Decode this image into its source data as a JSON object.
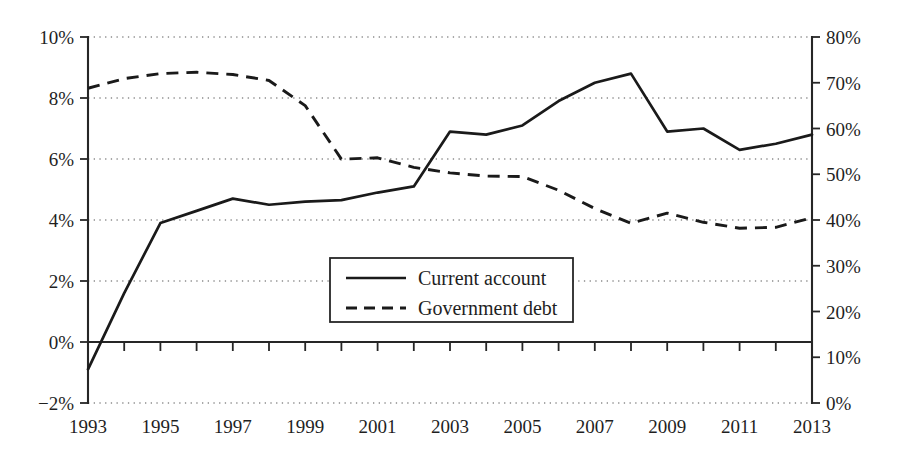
{
  "chart_data": {
    "type": "line",
    "title": "",
    "subtitle": "",
    "xlabel": "",
    "grid": "dotted-horizontal",
    "legend_position": "inside-bottom-center",
    "x": [
      1993,
      1994,
      1995,
      1996,
      1997,
      1998,
      1999,
      2000,
      2001,
      2002,
      2003,
      2004,
      2005,
      2006,
      2007,
      2008,
      2009,
      2010,
      2011,
      2012,
      2013
    ],
    "x_tick_labels": [
      "1993",
      "1995",
      "1997",
      "1999",
      "2001",
      "2003",
      "2005",
      "2007",
      "2009",
      "2011",
      "2013"
    ],
    "x_tick_values": [
      1993,
      1995,
      1997,
      1999,
      2001,
      2003,
      2005,
      2007,
      2009,
      2011,
      2013
    ],
    "xlim": [
      1993,
      2013
    ],
    "axes": [
      {
        "id": "left",
        "side": "left",
        "ylabel": "",
        "ylim": [
          -2,
          10
        ],
        "tick_values": [
          -2,
          0,
          2,
          4,
          6,
          8,
          10
        ],
        "tick_labels": [
          "−2%",
          "0%",
          "2%",
          "4%",
          "6%",
          "8%",
          "10%"
        ]
      },
      {
        "id": "right",
        "side": "right",
        "ylabel": "",
        "ylim": [
          0,
          80
        ],
        "tick_values": [
          0,
          10,
          20,
          30,
          40,
          50,
          60,
          70,
          80
        ],
        "tick_labels": [
          "0%",
          "10%",
          "20%",
          "30%",
          "40%",
          "50%",
          "60%",
          "70%",
          "80%"
        ]
      }
    ],
    "series": [
      {
        "name": "Current account",
        "axis": "left",
        "style": "solid",
        "color": "#1a1a1a",
        "values": [
          -0.9,
          1.6,
          3.9,
          4.3,
          4.7,
          4.5,
          4.6,
          4.65,
          4.9,
          5.1,
          6.9,
          6.8,
          7.1,
          7.9,
          8.5,
          8.8,
          6.9,
          7.0,
          6.3,
          6.5,
          6.8
        ]
      },
      {
        "name": "Government debt",
        "axis": "right",
        "style": "dashed",
        "color": "#1a1a1a",
        "values": [
          68.8,
          70.9,
          72.0,
          72.3,
          71.8,
          70.5,
          65.0,
          53.3,
          53.6,
          51.5,
          50.3,
          49.6,
          49.5,
          46.5,
          42.5,
          39.3,
          41.5,
          39.5,
          38.2,
          38.4,
          40.5
        ]
      }
    ],
    "legend": [
      {
        "label": "Current account",
        "style": "solid"
      },
      {
        "label": "Government debt",
        "style": "dashed"
      }
    ]
  },
  "accent_color": "#1a1a1a",
  "background_color": "#ffffff"
}
